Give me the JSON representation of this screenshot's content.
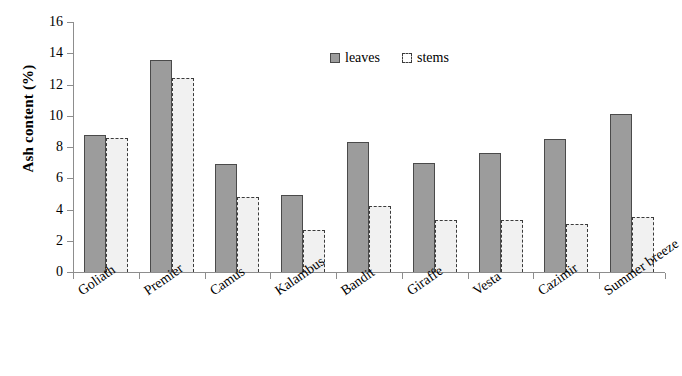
{
  "chart_data": {
    "type": "bar",
    "title": "",
    "xlabel": "",
    "ylabel": "Ash content (%)",
    "ylim": [
      0,
      16
    ],
    "ytick_step": 2,
    "yticks": [
      0,
      2,
      4,
      6,
      8,
      10,
      12,
      14,
      16
    ],
    "ytick_labels": [
      "0",
      "2",
      "4",
      "6",
      "8",
      "10",
      "12",
      "14",
      "16"
    ],
    "grid": false,
    "legend_position": "top-center",
    "categories": [
      "Goliath",
      "Premier",
      "Camus",
      "Kalambus",
      "Bandit",
      "Giraffe",
      "Vesta",
      "Cazimir",
      "Summer breeze"
    ],
    "series": [
      {
        "name": "leaves",
        "color": "#9c9c9c",
        "values": [
          8.8,
          13.6,
          6.9,
          4.9,
          8.3,
          7.0,
          7.6,
          8.5,
          10.1
        ]
      },
      {
        "name": "stems",
        "color": "#f1f1f1",
        "values": [
          8.6,
          12.4,
          4.8,
          2.7,
          4.2,
          3.3,
          3.3,
          3.1,
          3.5
        ]
      }
    ]
  },
  "legend": {
    "items": [
      {
        "label": "leaves",
        "swatch": "legend-swatch-leaves"
      },
      {
        "label": "stems",
        "swatch": "legend-swatch-stems"
      }
    ]
  },
  "colors": {
    "leaves_fill": "#9c9c9c",
    "leaves_border": "#4a4a4a",
    "stems_fill": "#f1f1f1",
    "stems_border": "#3b3b3b",
    "axis": "#8d8d8d",
    "text": "#000000",
    "background": "#ffffff"
  }
}
